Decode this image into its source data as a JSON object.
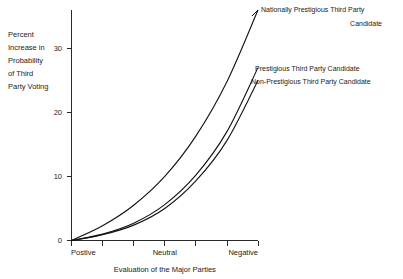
{
  "chart_data": {
    "type": "line",
    "title": "",
    "xlabel": "Evaluation of the Major Parties",
    "ylabel": "Percent Increase in Probability of Third Party Voting",
    "ylabel_lines": [
      "Percent",
      "Increase in",
      "Probability",
      "of Third",
      "Party Voting"
    ],
    "x": [
      0,
      1,
      2,
      3,
      4,
      5,
      6
    ],
    "xlim": [
      0,
      6
    ],
    "ylim": [
      0,
      36
    ],
    "ytick_values": [
      0,
      10,
      20,
      30
    ],
    "ytick_labels": [
      "0",
      "10",
      "20",
      "30"
    ],
    "xtick_count": 7,
    "xtick_labels_shown": [
      "Postive",
      "Neutral",
      "Negative"
    ],
    "xtick_label_positions": [
      0,
      3,
      6
    ],
    "grid": false,
    "legend_position": "right-inline-annotations",
    "series": [
      {
        "name": "Nationally Prestigious Third Party Candidate",
        "label_lines": [
          "Nationally Prestigious Third Party",
          "Candidate"
        ],
        "color": "#111111",
        "values": [
          0.0,
          2.3,
          5.5,
          10.0,
          16.3,
          24.8,
          36.0
        ]
      },
      {
        "name": "Prestigious Third Party Candidate",
        "label_lines": [
          "Prestigious Third Party Candidate"
        ],
        "color": "#111111",
        "values": [
          0.0,
          1.0,
          2.7,
          5.6,
          10.2,
          17.0,
          27.0
        ]
      },
      {
        "name": "Non-Prestigious Third Party Candidate",
        "label_lines": [
          "Non-Prestigious Third Party Candidate"
        ],
        "color": "#111111",
        "values": [
          0.0,
          0.9,
          2.4,
          5.0,
          9.3,
          15.6,
          25.0
        ]
      }
    ]
  },
  "axis": {
    "x_title": "Evaluation of the Major Parties",
    "y_title_lines": [
      "Percent",
      "Increase in",
      "Probability",
      "of Third",
      "Party Voting"
    ],
    "x_cat_left": "Postive",
    "x_cat_mid": "Neutral",
    "x_cat_right": "Negative",
    "y_tick_0": "0",
    "y_tick_10": "10",
    "y_tick_20": "20",
    "y_tick_30": "30"
  },
  "annotations": {
    "top_line_1": "Nationally Prestigious Third Party",
    "top_line_2": "Candidate",
    "mid_line_1": "Prestigious Third Party Candidate",
    "bot_line_1": "Non-Prestigious Third Party Candidate"
  }
}
